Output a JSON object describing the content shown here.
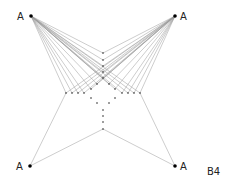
{
  "diagram": {
    "caption": "B4",
    "hubs": [
      {
        "id": "top-left",
        "label": "A",
        "x": 31,
        "y": 16
      },
      {
        "id": "top-right",
        "label": "A",
        "x": 175,
        "y": 16
      },
      {
        "id": "bottom-left",
        "label": "A",
        "x": 30,
        "y": 166
      },
      {
        "id": "bottom-right",
        "label": "A",
        "x": 175,
        "y": 166
      }
    ],
    "inner_nodes": {
      "top_column": [
        [
          103,
          53
        ],
        [
          103,
          60
        ],
        [
          103,
          66
        ],
        [
          103,
          72
        ],
        [
          103,
          78
        ]
      ],
      "left_row": [
        [
          66,
          93
        ],
        [
          72,
          93
        ],
        [
          78,
          93
        ],
        [
          84,
          93
        ]
      ],
      "right_row": [
        [
          122,
          93
        ],
        [
          128,
          93
        ],
        [
          134,
          93
        ],
        [
          140,
          93
        ]
      ],
      "diamond": [
        [
          97,
          84
        ],
        [
          91,
          89
        ],
        [
          109,
          84
        ],
        [
          115,
          89
        ],
        [
          91,
          98
        ],
        [
          97,
          103
        ],
        [
          115,
          98
        ],
        [
          109,
          103
        ]
      ],
      "bottom_column": [
        [
          103,
          110
        ],
        [
          103,
          116
        ],
        [
          103,
          122
        ],
        [
          103,
          129
        ]
      ]
    },
    "colors": {
      "edge": "#9a9a9a",
      "node": "#222222",
      "background": "#ffffff"
    }
  }
}
